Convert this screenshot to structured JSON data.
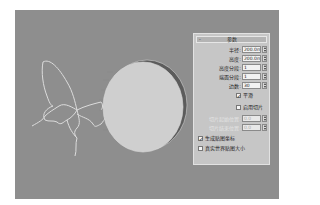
{
  "viewport": {
    "background_color": "#8e8e8e",
    "objects": [
      {
        "name": "butterfly-spline",
        "type": "spline-outline",
        "color": "#d8d8d8"
      },
      {
        "name": "cylinder",
        "type": "cylinder",
        "face_color": "#cfcfcf",
        "side_color": "#6a6a6a"
      }
    ]
  },
  "panel": {
    "rollout_title": "参数",
    "collapse_symbol": "-",
    "fields": [
      {
        "label": "半径:",
        "value": "200.0mm",
        "enabled": true
      },
      {
        "label": "高度:",
        "value": "200.0mm",
        "enabled": true
      },
      {
        "label": "高度分段:",
        "value": "1",
        "enabled": true
      },
      {
        "label": "端面分段:",
        "value": "1",
        "enabled": true
      },
      {
        "label": "边数:",
        "value": "30",
        "enabled": true
      }
    ],
    "smooth": {
      "label": "平滑",
      "checked": true
    },
    "slice_on": {
      "label": "启用切片",
      "checked": false
    },
    "slice_fields": [
      {
        "label": "切片起始位置:",
        "value": "0.0",
        "enabled": false
      },
      {
        "label": "切片结束位置:",
        "value": "0.0",
        "enabled": false
      }
    ],
    "gen_mapping": {
      "label": "生成贴图坐标",
      "checked": true
    },
    "real_world": {
      "label": "真实世界贴图大小",
      "checked": false
    },
    "check_mark": "✓"
  }
}
